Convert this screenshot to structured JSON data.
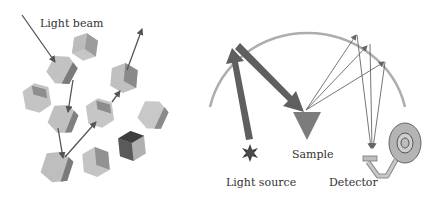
{
  "labels": {
    "light_beam": "Light beam",
    "sample": "Sample",
    "light_source": "Light source",
    "detector": "Detector"
  },
  "colors": {
    "background": "#ffffff",
    "arrow": "#555555",
    "thick_arrow": "#5f5f5f",
    "arc": "#aaaaaa",
    "cube_light": "#c4c4c4",
    "cube_mid": "#9a9a9a",
    "cube_dark": "#5a5a5a",
    "sample": "#7a7a7a",
    "source": "#4a4a4a",
    "detector": "#b8b8b8"
  },
  "left_panel": {
    "description": "Light beam scattered through randomly oriented crystal particles",
    "particle_count": 10
  },
  "right_panel": {
    "description": "Integrating sphere: light source reflects to sample, diffuse reflection collected to detector"
  }
}
